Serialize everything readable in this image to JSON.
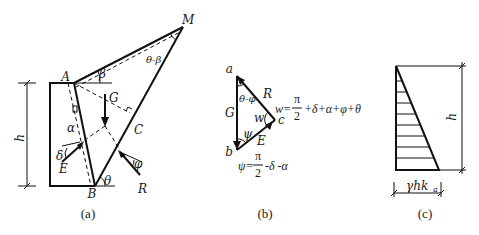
{
  "figure": {
    "panels": [
      {
        "id": "a",
        "caption": "(a)",
        "points": {
          "A": "A",
          "B": "B",
          "C": "C",
          "M": "M"
        },
        "forces": {
          "G": "G",
          "E": "E",
          "R": "R"
        },
        "angles": {
          "alpha": "α",
          "beta": "β",
          "delta": "δ",
          "phi": "φ",
          "theta": "θ",
          "theta_minus_beta": "θ-β"
        },
        "dimension": "h"
      },
      {
        "id": "b",
        "caption": "(b)",
        "points": {
          "a": "a",
          "b": "b",
          "c": "c"
        },
        "forces": {
          "G": "G",
          "R": "R",
          "E": "E"
        },
        "angles": {
          "theta_minus_phi": "θ-φ",
          "psi": "ψ",
          "w": "w"
        },
        "eq_w_lhs": "w=",
        "eq_w_rhs": "+δ+α+φ+θ",
        "eq_psi_lhs": "ψ=",
        "eq_psi_rhs": "-δ -α",
        "pi": "π",
        "two": "2"
      },
      {
        "id": "c",
        "caption": "(c)",
        "dimension": "h",
        "base_label": "γhk",
        "base_sub": "a"
      }
    ]
  }
}
